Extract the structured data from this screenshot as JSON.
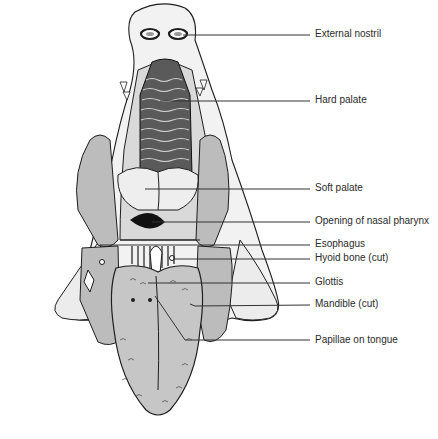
{
  "figure": {
    "colors": {
      "skin": "#f2f2f2",
      "bone_shading": "#bcbcbc",
      "tongue": "#c6c6c6",
      "ink": "#1e1e1e",
      "leader": "#333333"
    }
  },
  "labels": [
    {
      "id": "external-nostril",
      "text": "External nostril",
      "y": 34,
      "line_from_x": 158
    },
    {
      "id": "hard-palate",
      "text": "Hard palate",
      "y": 100,
      "line_from_x": 160
    },
    {
      "id": "soft-palate",
      "text": "Soft palate",
      "y": 188,
      "line_from_x": 145
    },
    {
      "id": "opening-of-nasal-pharynx",
      "text": "Opening of nasal pharynx",
      "y": 221,
      "line_from_x": 152
    },
    {
      "id": "esophagus",
      "text": "Esophagus",
      "y": 244,
      "line_from_x": 173
    },
    {
      "id": "hyoid-bone-cut",
      "text": "Hyoid bone (cut)",
      "y": 258,
      "line_from_x": 175
    },
    {
      "id": "glottis",
      "text": "Glottis",
      "y": 282,
      "line_from_x": 148
    },
    {
      "id": "mandible-cut",
      "text": "Mandible (cut)",
      "y": 304,
      "line_from_x": 190
    },
    {
      "id": "papillae-on-tongue",
      "text": "Papillae on tongue",
      "y": 340,
      "line_from_x": 190
    }
  ]
}
